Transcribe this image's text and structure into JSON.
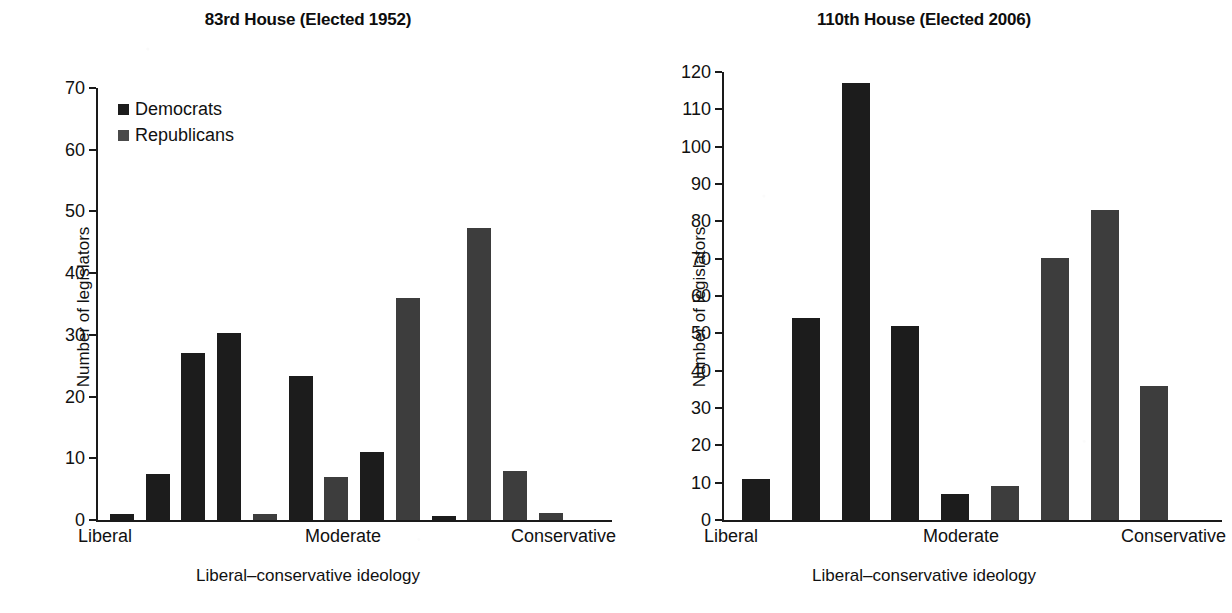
{
  "figure": {
    "background": "#ffffff",
    "dem_color": "#1c1c1c",
    "rep_color": "#3d3d3d"
  },
  "panels": [
    {
      "key": "left",
      "title": "83rd House (Elected 1952)",
      "ylabel": "Number of legislators",
      "xlabel": "Liberal–conservative ideology",
      "xticks": [
        "Liberal",
        "Moderate",
        "Conservative"
      ],
      "yticks": [
        "0",
        "10",
        "20",
        "30",
        "40",
        "50",
        "60",
        "70"
      ],
      "legend": [
        {
          "label": "Democrats",
          "color": "#1c1c1c"
        },
        {
          "label": "Republicans",
          "color": "#4a4a4a"
        }
      ]
    },
    {
      "key": "right",
      "title": "110th House (Elected 2006)",
      "ylabel": "Number of legislators",
      "xlabel": "Liberal–conservative ideology",
      "xticks": [
        "Liberal",
        "Moderate",
        "Conservative"
      ],
      "yticks": [
        "0",
        "10",
        "20",
        "30",
        "40",
        "50",
        "60",
        "70",
        "80",
        "90",
        "100",
        "110",
        "120"
      ],
      "legend": []
    }
  ],
  "chart_data": [
    {
      "type": "bar",
      "title": "83rd House (Elected 1952)",
      "xlabel": "Liberal–conservative ideology",
      "ylabel": "Number of legislators",
      "ylim": [
        0,
        70
      ],
      "yticks": [
        0,
        10,
        20,
        30,
        40,
        50,
        60,
        70
      ],
      "xtick_labels": [
        "Liberal",
        "Moderate",
        "Conservative"
      ],
      "xtick_positions": [
        0,
        5.5,
        10
      ],
      "grid": false,
      "legend": [
        "Democrats",
        "Republicans"
      ],
      "legend_position": "upper left",
      "bars": [
        {
          "index": 0,
          "series": "Democrats",
          "value": 1
        },
        {
          "index": 1,
          "series": "Democrats",
          "value": 7.5
        },
        {
          "index": 2,
          "series": "Democrats",
          "value": 27
        },
        {
          "index": 3,
          "series": "Democrats",
          "value": 30.3
        },
        {
          "index": 4,
          "series": "Republicans",
          "value": 1
        },
        {
          "index": 5,
          "series": "Democrats",
          "value": 23.4
        },
        {
          "index": 6,
          "series": "Republicans",
          "value": 7
        },
        {
          "index": 7,
          "series": "Democrats",
          "value": 11
        },
        {
          "index": 8,
          "series": "Republicans",
          "value": 36
        },
        {
          "index": 9,
          "series": "Democrats",
          "value": 0.7
        },
        {
          "index": 10,
          "series": "Republicans",
          "value": 47.3
        },
        {
          "index": 11,
          "series": "Republicans",
          "value": 8
        },
        {
          "index": 12,
          "series": "Republicans",
          "value": 1.1
        }
      ]
    },
    {
      "type": "bar",
      "title": "110th House (Elected 2006)",
      "xlabel": "Liberal–conservative ideology",
      "ylabel": "Number of legislators",
      "ylim": [
        0,
        120
      ],
      "yticks": [
        0,
        10,
        20,
        30,
        40,
        50,
        60,
        70,
        80,
        90,
        100,
        110,
        120
      ],
      "xtick_labels": [
        "Liberal",
        "Moderate",
        "Conservative"
      ],
      "xtick_positions": [
        0,
        4.5,
        8
      ],
      "grid": false,
      "legend": [],
      "bars": [
        {
          "index": 0,
          "series": "Democrats",
          "value": 11
        },
        {
          "index": 1,
          "series": "Democrats",
          "value": 54
        },
        {
          "index": 2,
          "series": "Democrats",
          "value": 117
        },
        {
          "index": 3,
          "series": "Democrats",
          "value": 52
        },
        {
          "index": 4,
          "series": "Democrats",
          "value": 7
        },
        {
          "index": 5,
          "series": "Republicans",
          "value": 9
        },
        {
          "index": 6,
          "series": "Republicans",
          "value": 70.3
        },
        {
          "index": 7,
          "series": "Republicans",
          "value": 83
        },
        {
          "index": 8,
          "series": "Republicans",
          "value": 36
        }
      ]
    }
  ]
}
